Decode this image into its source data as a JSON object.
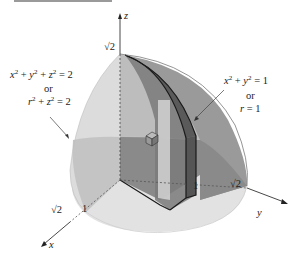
{
  "figure": {
    "type": "3d-solid-diagram",
    "colors": {
      "sphere_light": "#e6e6e6",
      "sphere_mid": "#cfcfcf",
      "sphere_band": "#a9a9a9",
      "cylinder": "#8f8f8f",
      "wedge": "#6c6c6c",
      "wedge_edge": "#1a1a1a",
      "floor": "#dedede",
      "axis": "#333333"
    }
  },
  "axes": {
    "z": {
      "label": "z",
      "tick": "√2"
    },
    "x": {
      "label": "x",
      "ticks": [
        "1",
        "√2"
      ]
    },
    "y": {
      "label": "y",
      "ticks": [
        "1",
        "√2"
      ]
    }
  },
  "annotations": {
    "sphere": {
      "line1_a": "x",
      "line1_b": "2",
      "line1_c": " + ",
      "line1_d": "y",
      "line1_e": "2",
      "line1_f": " + ",
      "line1_g": "z",
      "line1_h": "2",
      "line1_i": " = 2",
      "or": "or",
      "line2_a": "r",
      "line2_b": "2",
      "line2_c": " + ",
      "line2_d": "z",
      "line2_e": "2",
      "line2_f": " = 2"
    },
    "cylinder": {
      "line1_a": "x",
      "line1_b": "2",
      "line1_c": " + ",
      "line1_d": "y",
      "line1_e": "2",
      "line1_f": " = 1",
      "or": "or",
      "line2_a": "r",
      "line2_b": " = 1"
    }
  }
}
